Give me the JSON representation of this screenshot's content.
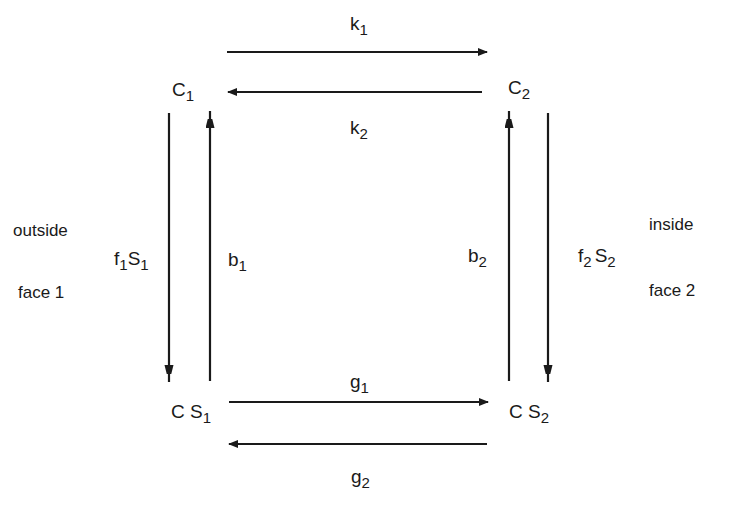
{
  "diagram": {
    "nodes": {
      "c1": {
        "main": "C",
        "sub": "1"
      },
      "c2": {
        "main": "C",
        "sub": "2"
      },
      "cs1": {
        "main": "C S",
        "sub": "1"
      },
      "cs2": {
        "main": "C S",
        "sub": "2"
      }
    },
    "rates": {
      "k1": {
        "main": "k",
        "sub": "1"
      },
      "k2": {
        "main": "k",
        "sub": "2"
      },
      "g1": {
        "main": "g",
        "sub": "1"
      },
      "g2": {
        "main": "g",
        "sub": "2"
      },
      "b1": {
        "main": "b",
        "sub": "1"
      },
      "b2": {
        "main": "b",
        "sub": "2"
      },
      "f1S1": {
        "f": "f",
        "fsub": "1",
        "s": "S",
        "ssub": "1"
      },
      "f2S2": {
        "f": "f",
        "fsub": "2",
        "s": "S",
        "ssub": "2"
      }
    },
    "side_labels": {
      "left_top": "outside",
      "left_bottom": "face 1",
      "right_top": "inside",
      "right_bottom": "face 2"
    },
    "edges": [
      {
        "from": "C1",
        "to": "C2",
        "label": "k1"
      },
      {
        "from": "C2",
        "to": "C1",
        "label": "k2"
      },
      {
        "from": "C1",
        "to": "CS1",
        "label": "f1S1"
      },
      {
        "from": "CS1",
        "to": "C1",
        "label": "b1"
      },
      {
        "from": "CS2",
        "to": "C2",
        "label": "b2"
      },
      {
        "from": "C2",
        "to": "CS2",
        "label": "f2S2"
      },
      {
        "from": "CS1",
        "to": "CS2",
        "label": "g1"
      },
      {
        "from": "CS2",
        "to": "CS1",
        "label": "g2"
      }
    ],
    "colors": {
      "stroke": "#1a1a1a",
      "background": "#ffffff"
    }
  }
}
